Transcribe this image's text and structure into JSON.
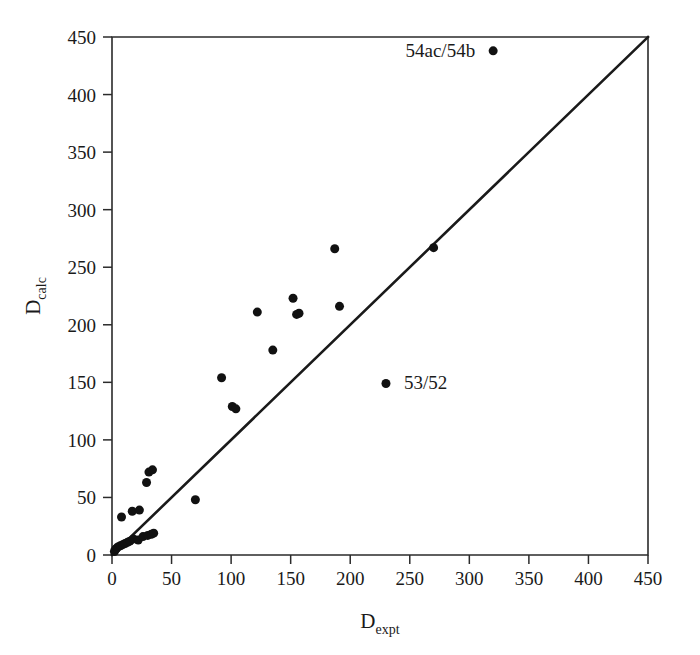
{
  "figure": {
    "width": 700,
    "height": 655,
    "background": "#ffffff",
    "foreground": "#1a1a1a"
  },
  "chart_data": {
    "type": "scatter",
    "title": "",
    "xlabel": "D_expt",
    "xlabel_base": "D",
    "xlabel_sub": "expt",
    "ylabel": "D_calc",
    "ylabel_base": "D",
    "ylabel_sub": "calc",
    "xlim": [
      0,
      450
    ],
    "ylim": [
      0,
      450
    ],
    "xticks": [
      0,
      50,
      100,
      150,
      200,
      250,
      300,
      350,
      400,
      450
    ],
    "yticks": [
      0,
      50,
      100,
      150,
      200,
      250,
      300,
      350,
      400,
      450
    ],
    "xtick_labels": [
      "0",
      "50",
      "100",
      "150",
      "200",
      "250",
      "300",
      "350",
      "400",
      "450"
    ],
    "ytick_labels": [
      "0",
      "50",
      "100",
      "150",
      "200",
      "250",
      "300",
      "350",
      "400",
      "450"
    ],
    "grid": false,
    "legend": false,
    "marker": "filled-circle",
    "marker_color": "#111111",
    "marker_size_px": 9,
    "reference_line": {
      "name": "identity-line",
      "equation": "y = x",
      "from": [
        0,
        0
      ],
      "to": [
        450,
        450
      ],
      "color": "#1a1a1a"
    },
    "x": [
      2,
      3,
      4,
      5,
      7,
      9,
      11,
      13,
      15,
      18,
      22,
      26,
      30,
      33,
      35,
      8,
      17,
      23,
      29,
      31,
      34,
      70,
      92,
      101,
      104,
      122,
      135,
      152,
      155,
      157,
      187,
      191,
      230,
      270,
      320
    ],
    "y": [
      3,
      5,
      6,
      7,
      8,
      9,
      10,
      11,
      12,
      14,
      13,
      16,
      17,
      18,
      19,
      33,
      38,
      39,
      63,
      72,
      74,
      48,
      154,
      129,
      127,
      211,
      178,
      223,
      209,
      210,
      266,
      216,
      149,
      267,
      438
    ],
    "points": [
      {
        "x": 2,
        "y": 3,
        "label": ""
      },
      {
        "x": 3,
        "y": 5,
        "label": ""
      },
      {
        "x": 4,
        "y": 6,
        "label": ""
      },
      {
        "x": 5,
        "y": 7,
        "label": ""
      },
      {
        "x": 7,
        "y": 8,
        "label": ""
      },
      {
        "x": 9,
        "y": 9,
        "label": ""
      },
      {
        "x": 11,
        "y": 10,
        "label": ""
      },
      {
        "x": 13,
        "y": 11,
        "label": ""
      },
      {
        "x": 15,
        "y": 12,
        "label": ""
      },
      {
        "x": 18,
        "y": 14,
        "label": ""
      },
      {
        "x": 22,
        "y": 13,
        "label": ""
      },
      {
        "x": 26,
        "y": 16,
        "label": ""
      },
      {
        "x": 30,
        "y": 17,
        "label": ""
      },
      {
        "x": 33,
        "y": 18,
        "label": ""
      },
      {
        "x": 35,
        "y": 19,
        "label": ""
      },
      {
        "x": 8,
        "y": 33,
        "label": ""
      },
      {
        "x": 17,
        "y": 38,
        "label": ""
      },
      {
        "x": 23,
        "y": 39,
        "label": ""
      },
      {
        "x": 29,
        "y": 63,
        "label": ""
      },
      {
        "x": 31,
        "y": 72,
        "label": ""
      },
      {
        "x": 34,
        "y": 74,
        "label": ""
      },
      {
        "x": 70,
        "y": 48,
        "label": ""
      },
      {
        "x": 92,
        "y": 154,
        "label": ""
      },
      {
        "x": 101,
        "y": 129,
        "label": ""
      },
      {
        "x": 104,
        "y": 127,
        "label": ""
      },
      {
        "x": 122,
        "y": 211,
        "label": ""
      },
      {
        "x": 135,
        "y": 178,
        "label": ""
      },
      {
        "x": 152,
        "y": 223,
        "label": ""
      },
      {
        "x": 155,
        "y": 209,
        "label": ""
      },
      {
        "x": 157,
        "y": 210,
        "label": ""
      },
      {
        "x": 187,
        "y": 266,
        "label": ""
      },
      {
        "x": 191,
        "y": 216,
        "label": ""
      },
      {
        "x": 230,
        "y": 149,
        "label": "53/52"
      },
      {
        "x": 270,
        "y": 267,
        "label": ""
      },
      {
        "x": 320,
        "y": 438,
        "label": "54ac/54b"
      }
    ],
    "annotations": [
      {
        "text": "54ac/54b",
        "point_x": 320,
        "point_y": 438,
        "anchor": "end",
        "dx": -18,
        "dy": 6
      },
      {
        "text": "53/52",
        "point_x": 230,
        "point_y": 149,
        "anchor": "start",
        "dx": 18,
        "dy": 6
      }
    ]
  }
}
